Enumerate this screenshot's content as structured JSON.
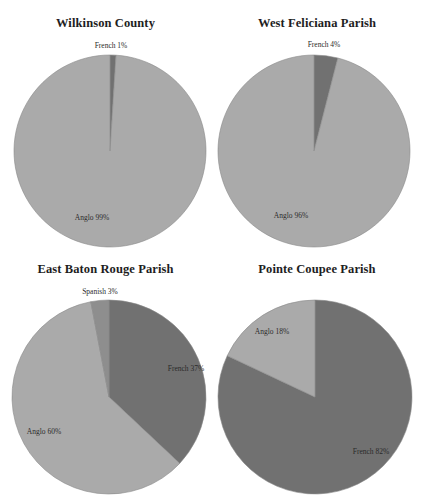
{
  "colors": {
    "French": "#717171",
    "Spanish": "#8e8e8e",
    "Anglo": "#aaaaaa",
    "background": "#ffffff",
    "outline": "#8a8a8a"
  },
  "chart_data": [
    {
      "type": "pie",
      "title": "Wilkinson County",
      "slices": [
        {
          "label": "French",
          "value": 1,
          "text": "French 1%"
        },
        {
          "label": "Anglo",
          "value": 99,
          "text": "Anglo 99%"
        }
      ],
      "start_angle": "12 o'clock",
      "direction": "clockwise"
    },
    {
      "type": "pie",
      "title": "West Feliciana Parish",
      "slices": [
        {
          "label": "French",
          "value": 4,
          "text": "French 4%"
        },
        {
          "label": "Anglo",
          "value": 96,
          "text": "Anglo 96%"
        }
      ],
      "start_angle": "12 o'clock",
      "direction": "clockwise"
    },
    {
      "type": "pie",
      "title": "East Baton Rouge Parish",
      "slices": [
        {
          "label": "French",
          "value": 37,
          "text": "French 37%"
        },
        {
          "label": "Anglo",
          "value": 60,
          "text": "Anglo 60%"
        },
        {
          "label": "Spanish",
          "value": 3,
          "text": "Spanish 3%"
        }
      ],
      "start_angle": "12 o'clock",
      "direction": "clockwise"
    },
    {
      "type": "pie",
      "title": "Pointe Coupee Parish",
      "slices": [
        {
          "label": "French",
          "value": 82,
          "text": "French 82%"
        },
        {
          "label": "Anglo",
          "value": 18,
          "text": "Anglo 18%"
        }
      ],
      "start_angle": "12 o'clock",
      "direction": "clockwise"
    }
  ],
  "layout": [
    {
      "left": 0,
      "top": 0,
      "width": 211,
      "title_top": 16,
      "cx": 110,
      "cy": 151,
      "r": 96,
      "labels": [
        {
          "x": 111,
          "y": 48,
          "anchor": "middle"
        },
        {
          "x": 92,
          "y": 220,
          "anchor": "middle"
        }
      ]
    },
    {
      "left": 211,
      "top": 0,
      "width": 212,
      "title_top": 16,
      "cx": 103,
      "cy": 151,
      "r": 96,
      "labels": [
        {
          "x": 113,
          "y": 47,
          "anchor": "middle"
        },
        {
          "x": 80,
          "y": 218,
          "anchor": "middle"
        }
      ]
    },
    {
      "left": 0,
      "top": 255,
      "width": 211,
      "title_top": 7,
      "cx": 109,
      "cy": 142,
      "r": 97,
      "labels": [
        {
          "x": 186,
          "y": 116,
          "anchor": "middle"
        },
        {
          "x": 44,
          "y": 179,
          "anchor": "middle"
        },
        {
          "x": 100,
          "y": 39,
          "anchor": "middle"
        }
      ]
    },
    {
      "left": 211,
      "top": 255,
      "width": 212,
      "title_top": 7,
      "cx": 104,
      "cy": 142,
      "r": 97,
      "labels": [
        {
          "x": 160,
          "y": 199,
          "anchor": "middle"
        },
        {
          "x": 61,
          "y": 79,
          "anchor": "middle"
        }
      ]
    }
  ]
}
